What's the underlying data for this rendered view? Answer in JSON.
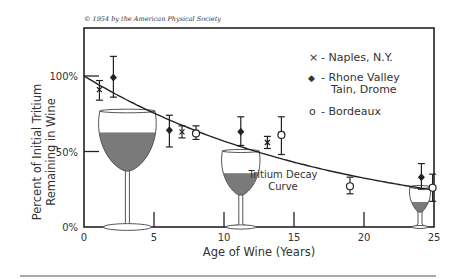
{
  "chart_data": {
    "type": "scatter",
    "title": "",
    "copyright": "© 1954 by the American Physical Society",
    "xlabel": "Age of Wine (Years)",
    "ylabel_line1": "Percent of Initial Tritium",
    "ylabel_line2": "Remaining in Wine",
    "xlim": [
      0,
      25
    ],
    "ylim": [
      0,
      100
    ],
    "x_ticks": [
      0,
      5,
      10,
      15,
      20,
      25
    ],
    "x_tick_labels": [
      "0",
      "5",
      "10",
      "15",
      "20",
      "25"
    ],
    "y_ticks": [
      0,
      50,
      100
    ],
    "y_tick_labels": [
      "0%",
      "50%",
      "100%"
    ],
    "grid": false,
    "legend_position": "upper right",
    "legend": [
      {
        "marker": "x",
        "symbol": "×",
        "label": "- Naples, N.Y."
      },
      {
        "marker": "diamond",
        "symbol": "◆",
        "label": "- Rhone Valley",
        "label2": "Tain, Drome"
      },
      {
        "marker": "circle",
        "symbol": "o",
        "label": "- Bordeaux"
      }
    ],
    "series": [
      {
        "name": "Naples, N.Y.",
        "marker": "x",
        "points": [
          {
            "x": 1.1,
            "y": 91,
            "err_low": 84,
            "err_high": 97
          },
          {
            "x": 7.0,
            "y": 63,
            "err_low": 59,
            "err_high": 67
          },
          {
            "x": 13.1,
            "y": 56,
            "err_low": 52,
            "err_high": 60
          }
        ]
      },
      {
        "name": "Rhone Valley Tain, Drome",
        "marker": "diamond",
        "points": [
          {
            "x": 2.1,
            "y": 99,
            "err_low": 86,
            "err_high": 113
          },
          {
            "x": 6.1,
            "y": 64,
            "err_low": 53,
            "err_high": 74
          },
          {
            "x": 11.2,
            "y": 63,
            "err_low": 54,
            "err_high": 73
          },
          {
            "x": 24.1,
            "y": 33,
            "err_low": 25,
            "err_high": 42
          }
        ]
      },
      {
        "name": "Bordeaux",
        "marker": "circle",
        "points": [
          {
            "x": 8.0,
            "y": 62,
            "err_low": 58,
            "err_high": 67
          },
          {
            "x": 14.1,
            "y": 61,
            "err_low": 48,
            "err_high": 73
          },
          {
            "x": 19.0,
            "y": 27,
            "err_low": 22,
            "err_high": 33
          },
          {
            "x": 24.9,
            "y": 26,
            "err_low": 17,
            "err_high": 35
          }
        ]
      }
    ],
    "curve": {
      "name": "Tritium Decay Curve",
      "label_line1": "Tritium Decay",
      "label_line2": "Curve",
      "half_life_years": 12.3,
      "description": "exponential decay from 100% at year 0"
    },
    "decorations": [
      {
        "type": "wine-glass",
        "size": "large",
        "x_center": 3.1,
        "fill_percent": 65
      },
      {
        "type": "wine-glass",
        "size": "medium",
        "x_center": 11.2,
        "fill_percent": 42
      },
      {
        "type": "wine-glass",
        "size": "small",
        "x_center": 24.0,
        "fill_percent": 21
      }
    ]
  },
  "colors": {
    "axis": "#222222",
    "text": "#333333",
    "wine": "#7a7a7a",
    "glass_outline": "#555555"
  }
}
